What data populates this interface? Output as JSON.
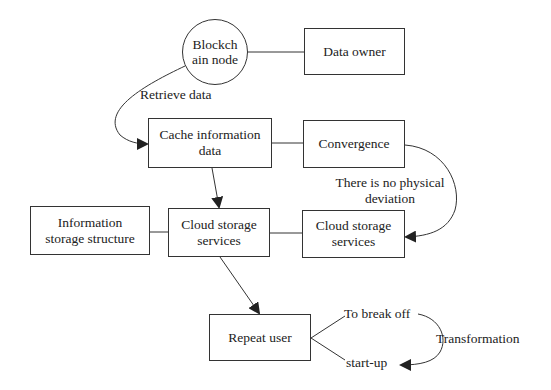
{
  "diagram": {
    "nodes": {
      "blockchain_node": {
        "line1": "Blockch",
        "line2": "ain node"
      },
      "data_owner": {
        "label": "Data owner"
      },
      "cache_info": {
        "line1": "Cache information",
        "line2": "data"
      },
      "convergence": {
        "label": "Convergence"
      },
      "info_storage": {
        "line1": "Information",
        "line2": "storage structure"
      },
      "cloud_mid": {
        "line1": "Cloud storage",
        "line2": "services"
      },
      "cloud_right": {
        "line1": "Cloud storage",
        "line2": "services"
      },
      "repeat_user": {
        "label": "Repeat user"
      }
    },
    "edge_labels": {
      "retrieve": "Retrieve data",
      "no_deviation_1": "There is no physical",
      "no_deviation_2": "deviation",
      "break_off": "To break off",
      "start_up": "start-up",
      "transformation": "Transformation"
    },
    "colors": {
      "stroke": "#333333",
      "background": "#ffffff",
      "text": "#222222"
    }
  }
}
